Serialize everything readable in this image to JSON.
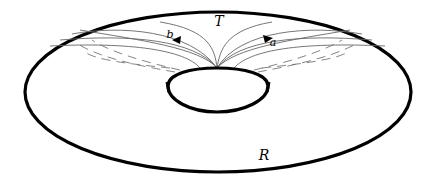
{
  "diagram": {
    "type": "torus-surface",
    "labels": {
      "top_region": "T",
      "bottom_region": "R",
      "curve_a": "a",
      "curve_b": "b"
    },
    "colors": {
      "outline": "#000000",
      "curves": "#555555",
      "dashed": "#666666",
      "background": "#ffffff"
    }
  }
}
